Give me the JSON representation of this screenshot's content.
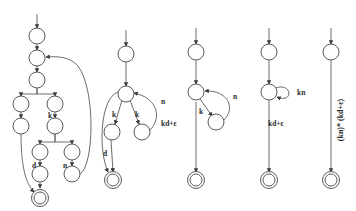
{
  "figure": {
    "kind": "finite-automata-transformation-sequence",
    "background_color": "#ffffff",
    "stroke_color": "#5b5b5b",
    "text_color": "#2b2b2b",
    "width": 356,
    "height": 211,
    "panel_count": 5
  },
  "panels": [
    {
      "id": "panel-1",
      "name": "expanded-automaton",
      "edge_labels": [
        "k",
        "d",
        "n"
      ],
      "nodes": [
        {
          "id": "p1-n1",
          "cx": 37,
          "cy": 36,
          "type": "state"
        },
        {
          "id": "p1-n2",
          "cx": 37,
          "cy": 58,
          "type": "state"
        },
        {
          "id": "p1-n3",
          "cx": 37,
          "cy": 80,
          "type": "state"
        },
        {
          "id": "p1-n4",
          "cx": 21,
          "cy": 104,
          "type": "state"
        },
        {
          "id": "p1-n5",
          "cx": 21,
          "cy": 126,
          "type": "state"
        },
        {
          "id": "p1-n6",
          "cx": 55,
          "cy": 104,
          "type": "state"
        },
        {
          "id": "p1-n7",
          "cx": 55,
          "cy": 126,
          "type": "state"
        },
        {
          "id": "p1-n8",
          "cx": 40,
          "cy": 152,
          "type": "state"
        },
        {
          "id": "p1-n9",
          "cx": 40,
          "cy": 174,
          "type": "state"
        },
        {
          "id": "p1-n10",
          "cx": 72,
          "cy": 152,
          "type": "state"
        },
        {
          "id": "p1-n11",
          "cx": 72,
          "cy": 174,
          "type": "state"
        },
        {
          "id": "p1-n12",
          "cx": 40,
          "cy": 198,
          "type": "accept"
        }
      ]
    },
    {
      "id": "panel-2",
      "name": "merged-k-branches-automaton",
      "edge_labels": [
        "k",
        "k",
        "n",
        "d"
      ],
      "nodes": [
        {
          "id": "p2-n1",
          "cx": 126,
          "cy": 54,
          "type": "state"
        },
        {
          "id": "p2-n2",
          "cx": 126,
          "cy": 94,
          "type": "state"
        },
        {
          "id": "p2-n3",
          "cx": 112,
          "cy": 132,
          "type": "state"
        },
        {
          "id": "p2-n4",
          "cx": 142,
          "cy": 132,
          "type": "state"
        },
        {
          "id": "p2-n5",
          "cx": 113,
          "cy": 180,
          "type": "accept"
        }
      ]
    },
    {
      "id": "panel-3",
      "name": "self-loop-k-n-automaton",
      "edge_labels": [
        "k",
        "n",
        "kd+ε"
      ],
      "nodes": [
        {
          "id": "p3-n1",
          "cx": 196,
          "cy": 52,
          "type": "state"
        },
        {
          "id": "p3-n2",
          "cx": 196,
          "cy": 92,
          "type": "state"
        },
        {
          "id": "p3-n3",
          "cx": 216,
          "cy": 122,
          "type": "state"
        },
        {
          "id": "p3-n4",
          "cx": 196,
          "cy": 180,
          "type": "accept"
        }
      ]
    },
    {
      "id": "panel-4",
      "name": "collapsed-kn-loop-automaton",
      "edge_labels": [
        "kn",
        "kd+ε"
      ],
      "nodes": [
        {
          "id": "p4-n1",
          "cx": 269,
          "cy": 52,
          "type": "state"
        },
        {
          "id": "p4-n2",
          "cx": 269,
          "cy": 92,
          "type": "state"
        },
        {
          "id": "p4-n3",
          "cx": 269,
          "cy": 180,
          "type": "accept"
        }
      ]
    },
    {
      "id": "panel-5",
      "name": "final-regex-automaton",
      "edge_labels": [
        "(kn)* (kd+ε)"
      ],
      "nodes": [
        {
          "id": "p5-n1",
          "cx": 331,
          "cy": 52,
          "type": "state"
        },
        {
          "id": "p5-n2",
          "cx": 331,
          "cy": 180,
          "type": "accept"
        }
      ]
    }
  ],
  "labels": {
    "p1_k": "k",
    "p1_d": "d",
    "p1_n": "n",
    "p2_k_left": "k",
    "p2_k_right": "k",
    "p2_n": "n",
    "p2_d": "d",
    "p3_k": "k",
    "p3_n": "n",
    "p3_kde": "kd+ε",
    "p4_kn": "kn",
    "p4_kde": "kd+ε",
    "p5_expr": "(kn)* (kd+ε)"
  }
}
